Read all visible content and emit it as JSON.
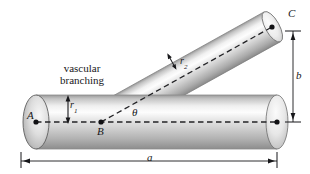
{
  "figure": {
    "annotation": {
      "line1": "vascular",
      "line2": "branching"
    },
    "points": {
      "A": "A",
      "B": "B",
      "C": "C"
    },
    "dimensions": {
      "horizontal_span": "a",
      "vertical_span": "b"
    },
    "angle": {
      "symbol": "θ"
    },
    "radii": {
      "main_symbol": "r",
      "main_sub": "1",
      "branch_symbol": "r",
      "branch_sub": "2"
    },
    "colors": {
      "ink": "#17171a",
      "tube_light": "#fbfbfb",
      "tube_mid": "#c9c9c9",
      "tube_dark": "#8e8e8e",
      "tube_edge": "#6f6f6f",
      "background": "#ffffff"
    }
  }
}
